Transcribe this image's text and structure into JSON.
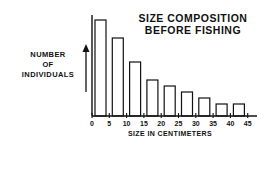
{
  "chart_data": {
    "type": "bar",
    "title": "SIZE COMPOSITION BEFORE FISHING",
    "title_lines": [
      "SIZE COMPOSITION",
      "BEFORE FISHING"
    ],
    "xlabel": "SIZE IN CENTIMETERS",
    "ylabel": "NUMBER OF INDIVIDUALS",
    "ylabel_lines": [
      "NUMBER",
      "OF",
      "INDIVIDUALS"
    ],
    "x_ticks": [
      "0",
      "5",
      "10",
      "15",
      "20",
      "25",
      "30",
      "35",
      "40",
      "45"
    ],
    "categories": [
      "0-5",
      "5-10",
      "10-15",
      "15-20",
      "20-25",
      "25-30",
      "30-35",
      "35-40",
      "40-45"
    ],
    "values": [
      96,
      78,
      54,
      36,
      30,
      24,
      18,
      12,
      12
    ],
    "value_units": "relative (no y scale shown)",
    "ylim": [
      0,
      100
    ],
    "grid": false,
    "legend": null,
    "bar_fill": "#ffffff",
    "bar_stroke": "#111111"
  }
}
